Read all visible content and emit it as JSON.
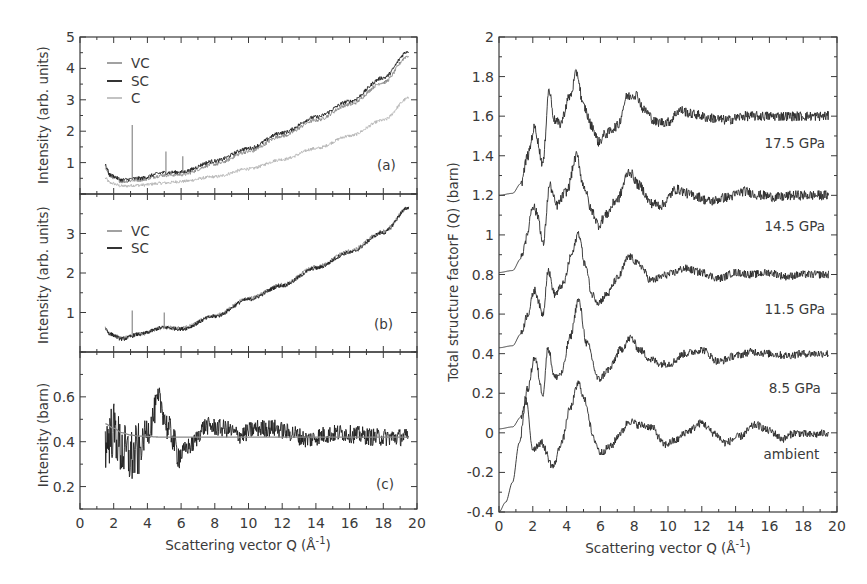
{
  "figure": {
    "left_xlabel": "Scattering vector  Q (Å",
    "left_xlabel_sup": "-1",
    "left_xlabel_close": ")",
    "right_xlabel": "Scattering vector Q (Å",
    "right_xlabel_sup": "-1",
    "right_xlabel_close": ")"
  },
  "chart_data": [
    {
      "id": "a",
      "type": "line",
      "panel_label": "(a)",
      "title": "",
      "xlabel": "",
      "ylabel": "Intensity (arb. units)",
      "xlim": [
        0,
        20
      ],
      "ylim": [
        0,
        5
      ],
      "yticks": [
        1,
        2,
        3,
        4,
        5
      ],
      "ytick_labels": [
        "1",
        "2",
        "3",
        "4",
        "5"
      ],
      "grid": false,
      "legend": {
        "position": "upper left",
        "entries": [
          "VC",
          "SC",
          "C"
        ]
      },
      "series": [
        {
          "name": "VC",
          "color": "#8a8a8a",
          "noise": 0.06,
          "x": [
            1.5,
            1.8,
            2.5,
            3.5,
            5,
            6,
            8,
            10,
            12,
            14,
            16,
            18,
            19.5
          ],
          "y": [
            0.85,
            0.55,
            0.4,
            0.45,
            0.6,
            0.62,
            0.95,
            1.35,
            1.85,
            2.35,
            2.85,
            3.55,
            4.4
          ]
        },
        {
          "name": "SC",
          "color": "#1e1e1e",
          "noise": 0.06,
          "x": [
            1.5,
            1.8,
            2.5,
            3.5,
            5,
            6,
            8,
            10,
            12,
            14,
            16,
            18,
            19.5
          ],
          "y": [
            0.9,
            0.6,
            0.45,
            0.5,
            0.68,
            0.7,
            1.05,
            1.45,
            1.95,
            2.45,
            2.95,
            3.7,
            4.55
          ]
        },
        {
          "name": "C",
          "color": "#b4b4b4",
          "noise": 0.05,
          "x": [
            1.5,
            1.8,
            2.5,
            3.5,
            5,
            6,
            8,
            10,
            12,
            14,
            16,
            18,
            19.5
          ],
          "y": [
            0.5,
            0.35,
            0.25,
            0.28,
            0.35,
            0.4,
            0.55,
            0.8,
            1.1,
            1.45,
            1.85,
            2.35,
            3.05
          ]
        }
      ],
      "spikes": [
        {
          "x": 3.1,
          "y": 2.2
        },
        {
          "x": 5.1,
          "y": 1.35
        },
        {
          "x": 6.1,
          "y": 1.2
        }
      ]
    },
    {
      "id": "b",
      "type": "line",
      "panel_label": "(b)",
      "ylabel": "Intensity (arb. units)",
      "xlim": [
        0,
        20
      ],
      "ylim": [
        0,
        4
      ],
      "yticks": [
        1,
        2,
        3
      ],
      "ytick_labels": [
        "1",
        "2",
        "3"
      ],
      "grid": false,
      "legend": {
        "position": "upper left",
        "entries": [
          "VC",
          "SC"
        ]
      },
      "series": [
        {
          "name": "VC",
          "color": "#8a8a8a",
          "noise": 0.05,
          "x": [
            1.5,
            1.8,
            2.5,
            3.5,
            5,
            6,
            8,
            10,
            12,
            14,
            16,
            18,
            19.5
          ],
          "y": [
            0.6,
            0.45,
            0.35,
            0.45,
            0.62,
            0.6,
            0.92,
            1.35,
            1.7,
            2.15,
            2.55,
            3.05,
            3.65
          ]
        },
        {
          "name": "SC",
          "color": "#1e1e1e",
          "noise": 0.05,
          "x": [
            1.5,
            1.8,
            2.5,
            3.5,
            5,
            6,
            8,
            10,
            12,
            14,
            16,
            18,
            19.5
          ],
          "y": [
            0.6,
            0.45,
            0.33,
            0.45,
            0.62,
            0.58,
            0.9,
            1.33,
            1.68,
            2.12,
            2.52,
            3.02,
            3.65
          ]
        }
      ],
      "spikes": [
        {
          "x": 3.1,
          "y": 1.05
        },
        {
          "x": 5.0,
          "y": 1.0
        }
      ]
    },
    {
      "id": "c",
      "type": "line",
      "panel_label": "(c)",
      "ylabel": "Intensity (barn)",
      "xlim": [
        0,
        20
      ],
      "ylim": [
        0.1,
        0.8
      ],
      "yticks": [
        0.2,
        0.4,
        0.6
      ],
      "ytick_labels": [
        "0.2",
        "0.4",
        "0.6"
      ],
      "xticks": [
        0,
        2,
        4,
        6,
        8,
        10,
        12,
        14,
        16,
        18,
        20
      ],
      "xtick_labels": [
        "0",
        "2",
        "4",
        "6",
        "8",
        "10",
        "12",
        "14",
        "16",
        "18",
        "20"
      ],
      "grid": false,
      "series": [
        {
          "name": "data",
          "color": "#1e1e1e",
          "noise": 0.04,
          "noise_decay": true,
          "x": [
            1.5,
            2.0,
            2.5,
            3.0,
            3.5,
            4.0,
            4.7,
            5.3,
            5.9,
            6.5,
            7.5,
            8.5,
            9.5,
            10.5,
            11.5,
            12.5,
            13.5,
            14.5,
            15.5,
            16.5,
            17.5,
            18.5,
            19.5
          ],
          "y": [
            0.4,
            0.45,
            0.36,
            0.33,
            0.36,
            0.45,
            0.58,
            0.45,
            0.34,
            0.38,
            0.47,
            0.46,
            0.43,
            0.46,
            0.46,
            0.44,
            0.41,
            0.43,
            0.44,
            0.43,
            0.42,
            0.42,
            0.42
          ]
        },
        {
          "name": "fit",
          "color": "#8a8a8a",
          "noise": 0,
          "x": [
            1.5,
            2.0,
            2.5,
            3.0,
            3.5,
            5,
            8,
            11,
            14,
            17,
            19.5
          ],
          "y": [
            0.48,
            0.46,
            0.44,
            0.43,
            0.425,
            0.42,
            0.42,
            0.42,
            0.42,
            0.42,
            0.42
          ]
        }
      ]
    },
    {
      "id": "right",
      "type": "line",
      "title": "",
      "xlabel": "Scattering vector Q (Å-1)",
      "ylabel": "Total structure factorF (Q) (barn)",
      "xlim": [
        0,
        20
      ],
      "ylim": [
        -0.4,
        2
      ],
      "yticks": [
        -0.4,
        -0.2,
        0,
        0.2,
        0.4,
        0.6,
        0.8,
        1,
        1.2,
        1.4,
        1.6,
        1.8,
        2
      ],
      "ytick_labels": [
        "-0.4",
        "-0.2",
        "0",
        "0.2",
        "0.4",
        "0.6",
        "0.8",
        "1",
        "1.2",
        "1.4",
        "1.6",
        "1.8",
        "2"
      ],
      "xticks": [
        0,
        2,
        4,
        6,
        8,
        10,
        12,
        14,
        16,
        18,
        20
      ],
      "xtick_labels": [
        "0",
        "2",
        "4",
        "6",
        "8",
        "10",
        "12",
        "14",
        "16",
        "18",
        "20"
      ],
      "grid": false,
      "series": [
        {
          "name": "17.5 GPa",
          "label_pos": [
            17.5,
            1.44
          ],
          "color": "#2a2a2a",
          "noise": 0.025,
          "x": [
            0,
            0.8,
            1.3,
            1.7,
            2.1,
            2.6,
            2.95,
            3.3,
            3.6,
            4.2,
            4.6,
            5.0,
            5.5,
            5.9,
            6.3,
            7.0,
            7.6,
            8.1,
            8.6,
            9.3,
            10.0,
            10.7,
            11.5,
            12.5,
            13.5,
            14.5,
            15.5,
            16.5,
            17.5,
            18.5,
            19.5
          ],
          "y": [
            1.2,
            1.21,
            1.26,
            1.4,
            1.54,
            1.36,
            1.73,
            1.58,
            1.56,
            1.7,
            1.82,
            1.65,
            1.55,
            1.47,
            1.51,
            1.55,
            1.7,
            1.71,
            1.63,
            1.57,
            1.57,
            1.63,
            1.61,
            1.59,
            1.58,
            1.6,
            1.6,
            1.6,
            1.6,
            1.6,
            1.6
          ]
        },
        {
          "name": "14.5 GPa",
          "label_pos": [
            17.5,
            1.02
          ],
          "color": "#2a2a2a",
          "noise": 0.025,
          "x": [
            0,
            0.8,
            1.3,
            1.6,
            2.0,
            2.3,
            2.6,
            3.0,
            3.4,
            4.0,
            4.6,
            5.0,
            5.5,
            5.9,
            6.3,
            7.0,
            7.7,
            8.3,
            9.0,
            9.6,
            10.5,
            11.5,
            12.5,
            13.5,
            14.5,
            15.5,
            16.5,
            17.5,
            18.5,
            19.5
          ],
          "y": [
            0.81,
            0.82,
            0.88,
            0.98,
            1.15,
            1.1,
            0.95,
            1.25,
            1.15,
            1.22,
            1.4,
            1.25,
            1.12,
            1.05,
            1.1,
            1.18,
            1.32,
            1.25,
            1.16,
            1.15,
            1.23,
            1.2,
            1.17,
            1.19,
            1.22,
            1.2,
            1.19,
            1.2,
            1.2,
            1.2
          ]
        },
        {
          "name": "11.5 GPa",
          "label_pos": [
            17.5,
            0.6
          ],
          "color": "#2a2a2a",
          "noise": 0.02,
          "x": [
            0,
            0.8,
            1.3,
            1.7,
            2.1,
            2.6,
            2.9,
            3.3,
            3.8,
            4.3,
            4.7,
            5.1,
            5.5,
            5.9,
            6.4,
            7.0,
            7.7,
            8.3,
            9.0,
            10.0,
            11.0,
            12.0,
            13.0,
            14.0,
            15.0,
            16.0,
            17.0,
            18.0,
            19.5
          ],
          "y": [
            0.43,
            0.44,
            0.5,
            0.6,
            0.72,
            0.6,
            0.82,
            0.7,
            0.75,
            0.9,
            1.01,
            0.85,
            0.7,
            0.66,
            0.7,
            0.78,
            0.89,
            0.85,
            0.77,
            0.8,
            0.83,
            0.81,
            0.78,
            0.81,
            0.8,
            0.81,
            0.79,
            0.8,
            0.8
          ]
        },
        {
          "name": "8.5 GPa",
          "label_pos": [
            17.5,
            0.2
          ],
          "color": "#2a2a2a",
          "noise": 0.02,
          "x": [
            0,
            0.8,
            1.3,
            1.7,
            2.1,
            2.6,
            2.9,
            3.3,
            3.7,
            4.2,
            4.7,
            5.2,
            5.9,
            6.5,
            7.2,
            7.8,
            8.3,
            9.0,
            9.6,
            10.1,
            11.0,
            12.0,
            13.0,
            14.0,
            15.0,
            16.0,
            17.0,
            18.0,
            19.5
          ],
          "y": [
            0.02,
            0.03,
            0.08,
            0.22,
            0.38,
            0.2,
            0.43,
            0.28,
            0.3,
            0.48,
            0.67,
            0.45,
            0.27,
            0.32,
            0.42,
            0.48,
            0.42,
            0.37,
            0.35,
            0.35,
            0.4,
            0.42,
            0.36,
            0.39,
            0.41,
            0.4,
            0.39,
            0.4,
            0.4
          ]
        },
        {
          "name": "ambient",
          "label_pos": [
            17.3,
            -0.13
          ],
          "color": "#2a2a2a",
          "noise": 0.02,
          "x": [
            0,
            0.4,
            0.8,
            1.2,
            1.6,
            2.0,
            2.5,
            3.2,
            3.7,
            4.2,
            4.7,
            5.1,
            5.6,
            6.0,
            6.6,
            7.2,
            7.7,
            8.3,
            9.0,
            9.8,
            10.4,
            11.2,
            12.0,
            12.7,
            13.4,
            14.2,
            15.2,
            16.0,
            16.8,
            17.5,
            18.5,
            19.5
          ],
          "y": [
            -0.4,
            -0.35,
            -0.25,
            -0.05,
            0.16,
            -0.08,
            -0.05,
            -0.17,
            -0.05,
            0.12,
            0.25,
            0.16,
            -0.03,
            -0.1,
            -0.07,
            0.0,
            0.06,
            0.04,
            0.03,
            -0.06,
            -0.04,
            0.01,
            0.05,
            0.0,
            -0.05,
            -0.02,
            0.04,
            0.01,
            -0.03,
            0.0,
            -0.01,
            0.0
          ]
        }
      ]
    }
  ]
}
